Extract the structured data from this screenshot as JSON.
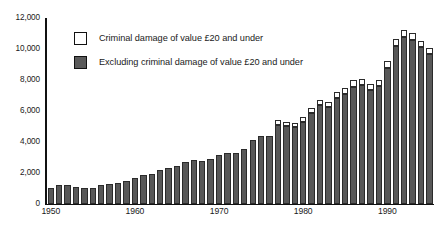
{
  "chart_data": {
    "type": "bar",
    "title": "",
    "subtitle": "",
    "xlabel": "",
    "ylabel": "",
    "stacked": true,
    "grid": false,
    "legend_position": "top-left",
    "ylim": [
      0,
      12000
    ],
    "ytick_labels": [
      "12,000",
      "10,000",
      "8,000",
      "6,000",
      "4,000",
      "2,000",
      "0"
    ],
    "ytick_values": [
      12000,
      10000,
      8000,
      6000,
      4000,
      2000,
      0
    ],
    "xtick_labels": [
      "1950",
      "1960",
      "1970",
      "1980",
      "1990"
    ],
    "xtick_values": [
      1950,
      1960,
      1970,
      1980,
      1990
    ],
    "categories": [
      1950,
      1951,
      1952,
      1953,
      1954,
      1955,
      1956,
      1957,
      1958,
      1959,
      1960,
      1961,
      1962,
      1963,
      1964,
      1965,
      1966,
      1967,
      1968,
      1969,
      1970,
      1971,
      1972,
      1973,
      1974,
      1975,
      1976,
      1977,
      1978,
      1979,
      1980,
      1981,
      1982,
      1983,
      1984,
      1985,
      1986,
      1987,
      1988,
      1989,
      1990,
      1991,
      1992,
      1993,
      1994,
      1995
    ],
    "series": [
      {
        "name": "Excluding criminal damage of value £20 and under",
        "color": "#585858",
        "values": [
          1050,
          1250,
          1210,
          1120,
          1030,
          1030,
          1230,
          1300,
          1370,
          1500,
          1670,
          1850,
          1950,
          2180,
          2350,
          2450,
          2680,
          2840,
          2790,
          2910,
          3190,
          3290,
          3270,
          3540,
          4120,
          4390,
          4380,
          5130,
          5060,
          4950,
          5320,
          5880,
          6380,
          6240,
          6850,
          7080,
          7580,
          7650,
          7370,
          7620,
          8800,
          10200,
          10790,
          10600,
          10120,
          9700
        ]
      },
      {
        "name": "Criminal damage of value £20 and under",
        "color": "#ffffff",
        "values": [
          0,
          0,
          0,
          0,
          0,
          0,
          0,
          0,
          0,
          0,
          0,
          0,
          0,
          0,
          0,
          0,
          0,
          0,
          0,
          0,
          0,
          0,
          0,
          0,
          0,
          0,
          0,
          260,
          260,
          280,
          280,
          320,
          310,
          330,
          350,
          380,
          390,
          400,
          390,
          390,
          420,
          430,
          440,
          440,
          400,
          390
        ]
      }
    ]
  },
  "legend": {
    "items": [
      {
        "label": "Criminal damage of value £20 and under",
        "swatch": "white"
      },
      {
        "label": "Excluding criminal damage of value £20 and under",
        "swatch": "dark"
      }
    ]
  },
  "colors": {
    "bar_dark": "#585858",
    "bar_white": "#ffffff",
    "bar_outline": "#2b2b2b",
    "axis": "#111111",
    "text": "#1a1a1a"
  }
}
